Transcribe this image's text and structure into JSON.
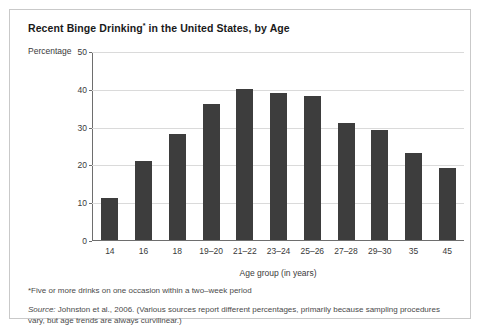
{
  "figure": {
    "title_main": "Recent Binge Drinking",
    "title_marker": "*",
    "title_rest": " in the United States, by Age",
    "footnote": "*Five or more drinks on one occasion within a two–week period",
    "source_word": "Source:",
    "source_text": " Johnston et al., 2006. (Various sources report different percentages, primarily because sampling procedures vary, but age trends are always curvilinear.)"
  },
  "chart_data": {
    "type": "bar",
    "title": "Recent Binge Drinking* in the United States, by Age",
    "xlabel": "Age group (in years)",
    "ylabel": "Percentage",
    "ylim": [
      0,
      50
    ],
    "yticks": [
      0,
      10,
      20,
      30,
      40,
      50
    ],
    "ytick_labels": [
      "0",
      "10",
      "20",
      "30",
      "40",
      "50"
    ],
    "grid": true,
    "legend": null,
    "bar_color": "#3d3d3d",
    "categories": [
      "14",
      "16",
      "18",
      "19–20",
      "21–22",
      "23–24",
      "25–26",
      "27–28",
      "29–30",
      "35",
      "45"
    ],
    "values": [
      11,
      21,
      28,
      36,
      40,
      39,
      38,
      31,
      29,
      23,
      19
    ]
  }
}
